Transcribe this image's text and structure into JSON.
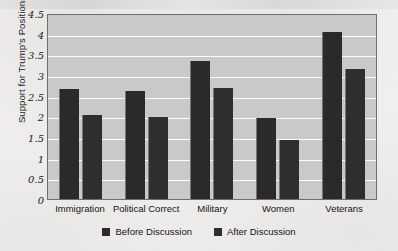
{
  "chart_data": {
    "type": "bar",
    "title": "",
    "subtitle": "",
    "xlabel": "",
    "ylabel": "Support for Trump's Positions",
    "categories": [
      "Immigration",
      "Political Correct",
      "Military",
      "Women",
      "Veterans"
    ],
    "series": [
      {
        "name": "Before Discussion",
        "color": "#2a2a2a",
        "values": [
          2.65,
          2.62,
          3.33,
          1.95,
          4.05
        ]
      },
      {
        "name": "After Discussion",
        "color": "#2e2e2e",
        "values": [
          2.04,
          1.98,
          2.68,
          1.42,
          3.15
        ]
      }
    ],
    "ylim": [
      0,
      4.5
    ],
    "ytick_labels": [
      "4.5",
      "4",
      "3.5",
      "3",
      "2.5",
      "2",
      "1.5",
      "1",
      "0.5",
      "0"
    ],
    "ytick_values": [
      4.5,
      4,
      3.5,
      3,
      2.5,
      2,
      1.5,
      1,
      0.5,
      0
    ],
    "grid": true,
    "grid_color": "#fbfbfb",
    "plot_background": "#c9c9c9",
    "plot_border_color": "#6e6e6e",
    "legend_position": "bottom"
  },
  "legend": {
    "items": [
      {
        "label": "Before Discussion",
        "color": "#2a2a2a"
      },
      {
        "label": "After Discussion",
        "color": "#2e2e2e"
      }
    ]
  }
}
